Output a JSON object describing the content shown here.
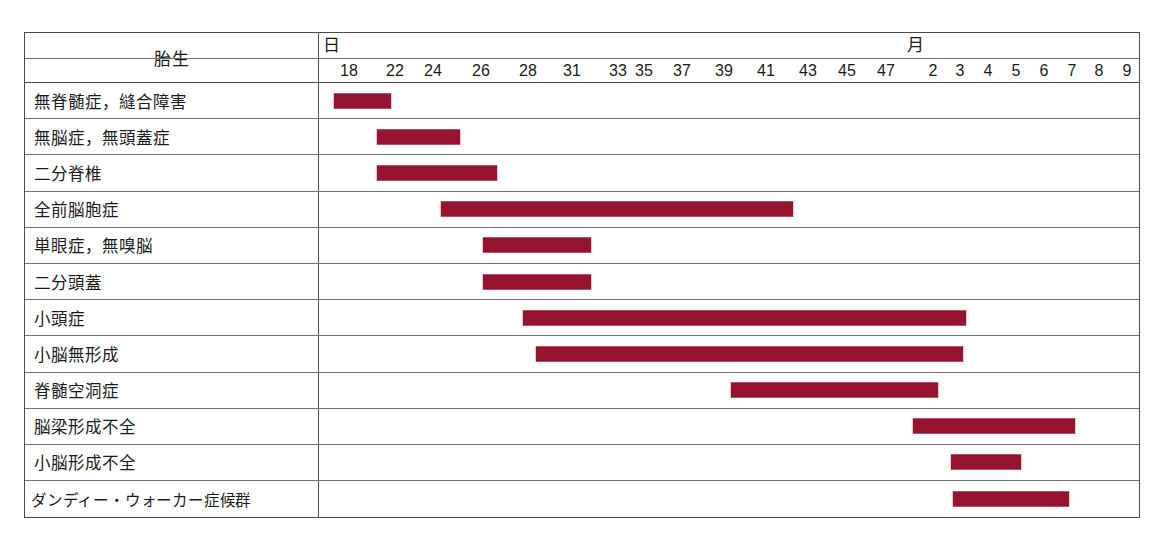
{
  "chart_data": {
    "type": "bar",
    "title": "",
    "xlabel": "",
    "ylabel": "",
    "orientation": "horizontal-gantt",
    "units": {
      "days_label": "日",
      "months_label": "月"
    },
    "axis_ticks_days": [
      "18",
      "22",
      "24",
      "26",
      "28",
      "31",
      "33",
      "35",
      "37",
      "39",
      "41",
      "43",
      "45",
      "47"
    ],
    "axis_ticks_months": [
      "2",
      "3",
      "4",
      "5",
      "6",
      "7",
      "8",
      "9"
    ],
    "bar_color": "#96132f",
    "grid": true,
    "legend_position": "none",
    "categories": [
      "無脊髄症，縫合障害",
      "無脳症，無頭蓋症",
      "二分脊椎",
      "全前脳胞症",
      "単眼症，無嗅脳",
      "二分頭蓋",
      "小頭症",
      "小脳無形成",
      "脊髄空洞症",
      "脳梁形成不全",
      "小脳形成不全",
      "ダンディー・ウォーカー症候群"
    ],
    "spans": [
      {
        "category": "無脊髄症，縫合障害",
        "start_label": "18",
        "end_label": "22"
      },
      {
        "category": "無脳症，無頭蓋症",
        "start_label": "22",
        "end_label": "26"
      },
      {
        "category": "二分脊椎",
        "start_label": "22",
        "end_label": "28"
      },
      {
        "category": "全前脳胞症",
        "start_label": "24",
        "end_label": "41"
      },
      {
        "category": "単眼症，無嗅脳",
        "start_label": "26",
        "end_label": "30"
      },
      {
        "category": "二分頭蓋",
        "start_label": "26",
        "end_label": "30"
      },
      {
        "category": "小頭症",
        "start_label": "28",
        "end_label": "4"
      },
      {
        "category": "小脳無形成",
        "start_label": "28",
        "end_label": "4"
      },
      {
        "category": "脊髄空洞症",
        "start_label": "39",
        "end_label": "3"
      },
      {
        "category": "脳梁形成不全",
        "start_label": "2",
        "end_label": "7"
      },
      {
        "category": "小脳形成不全",
        "start_label": "3",
        "end_label": "5"
      },
      {
        "category": "ダンディー・ウォーカー症候群",
        "start_label": "3",
        "end_label": "7"
      }
    ]
  },
  "header": {
    "stub_title": "胎生",
    "day_unit": "日",
    "month_unit": "月",
    "day_ticks": [
      {
        "label": "18",
        "x": 30
      },
      {
        "label": "22",
        "x": 76
      },
      {
        "label": "24",
        "x": 114
      },
      {
        "label": "26",
        "x": 162
      },
      {
        "label": "28",
        "x": 209
      },
      {
        "label": "31",
        "x": 253
      },
      {
        "label": "33",
        "x": 299
      },
      {
        "label": "35",
        "x": 325
      },
      {
        "label": "37",
        "x": 363
      },
      {
        "label": "39",
        "x": 405
      },
      {
        "label": "41",
        "x": 447
      },
      {
        "label": "43",
        "x": 489
      },
      {
        "label": "45",
        "x": 528
      },
      {
        "label": "47",
        "x": 567
      }
    ],
    "month_ticks": [
      {
        "label": "2",
        "x": 614
      },
      {
        "label": "3",
        "x": 641
      },
      {
        "label": "4",
        "x": 669
      },
      {
        "label": "5",
        "x": 697
      },
      {
        "label": "6",
        "x": 725
      },
      {
        "label": "7",
        "x": 753
      },
      {
        "label": "8",
        "x": 780
      },
      {
        "label": "9",
        "x": 808
      }
    ]
  },
  "rows": [
    {
      "label": "無脊髄症，縫合障害",
      "bar_left": 15,
      "bar_width": 57,
      "tight": false
    },
    {
      "label": "無脳症，無頭蓋症",
      "bar_left": 58,
      "bar_width": 83,
      "tight": false
    },
    {
      "label": "二分脊椎",
      "bar_left": 58,
      "bar_width": 120,
      "tight": false
    },
    {
      "label": "全前脳胞症",
      "bar_left": 122,
      "bar_width": 352,
      "tight": false
    },
    {
      "label": "単眼症，無嗅脳",
      "bar_left": 164,
      "bar_width": 108,
      "tight": false
    },
    {
      "label": "二分頭蓋",
      "bar_left": 164,
      "bar_width": 108,
      "tight": false
    },
    {
      "label": "小頭症",
      "bar_left": 204,
      "bar_width": 443,
      "tight": false
    },
    {
      "label": "小脳無形成",
      "bar_left": 217,
      "bar_width": 427,
      "tight": false
    },
    {
      "label": "脊髄空洞症",
      "bar_left": 412,
      "bar_width": 207,
      "tight": false
    },
    {
      "label": "脳梁形成不全",
      "bar_left": 594,
      "bar_width": 162,
      "tight": false
    },
    {
      "label": "小脳形成不全",
      "bar_left": 632,
      "bar_width": 70,
      "tight": false
    },
    {
      "label": "ダンディー・ウォーカー症候群",
      "bar_left": 634,
      "bar_width": 116,
      "tight": true
    }
  ]
}
